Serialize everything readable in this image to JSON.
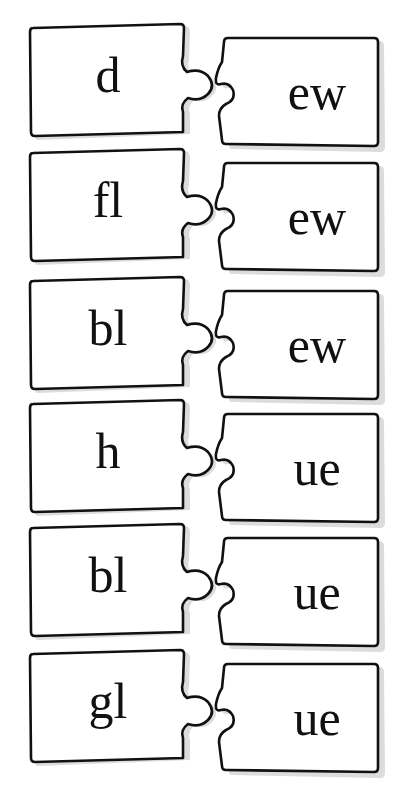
{
  "worksheet": {
    "type": "word-building puzzle pieces",
    "pairs": [
      {
        "onset": "d",
        "rime": "ew",
        "top": 22
      },
      {
        "onset": "fl",
        "rime": "ew",
        "top": 147
      },
      {
        "onset": "bl",
        "rime": "ew",
        "top": 275
      },
      {
        "onset": "h",
        "rime": "ue",
        "top": 398
      },
      {
        "onset": "bl",
        "rime": "ue",
        "top": 522
      },
      {
        "onset": "gl",
        "rime": "ue",
        "top": 648
      }
    ]
  },
  "colors": {
    "outline": "#111111",
    "fill": "#ffffff",
    "shadow": "#d9d9d9",
    "text": "#111111"
  }
}
